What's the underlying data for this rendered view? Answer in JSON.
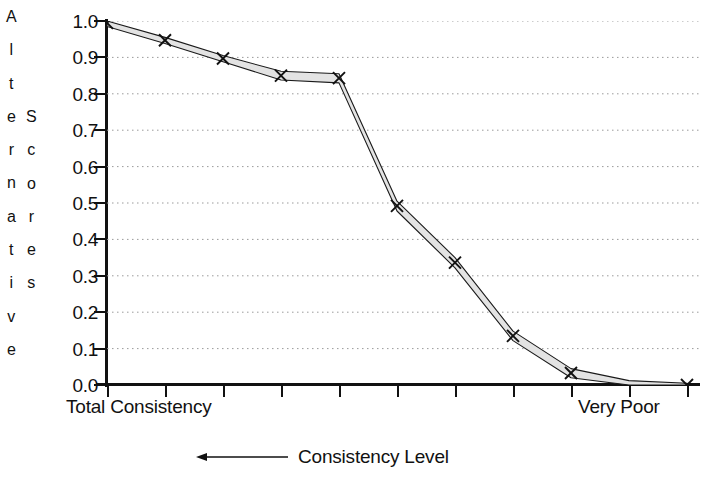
{
  "chart_data": {
    "type": "line",
    "title": "",
    "ylabel": "Alternative Scores",
    "ylabel_columns": [
      "Alternative",
      "Scores"
    ],
    "xlabel": "Consistency Level",
    "xlabel_arrow": "left-arrow-icon",
    "xtick_labels": [
      "Total Consistency",
      "Very Poor"
    ],
    "ytick_labels": [
      "1.0",
      "0.9",
      "0.8",
      "0.7",
      "0.6",
      "0.5",
      "0.4",
      "0.3",
      "0.2",
      "0.1",
      "0.0"
    ],
    "ylim": [
      0.0,
      1.0
    ],
    "ytick_values": [
      1.0,
      0.9,
      0.8,
      0.7,
      0.6,
      0.5,
      0.4,
      0.3,
      0.2,
      0.1,
      0.0
    ],
    "grid": "horizontal-dotted",
    "legend": "none",
    "marker": "x",
    "band_fill": "#e3e3e3",
    "line_color": "#1a1a1a",
    "x": [
      0,
      1,
      2,
      3,
      4,
      5,
      6,
      7,
      8,
      9,
      10
    ],
    "series": [
      {
        "name": "Alternative score (upper bound)",
        "values": [
          1.0,
          0.955,
          0.905,
          0.862,
          0.855,
          0.505,
          0.35,
          0.148,
          0.045,
          0.012,
          0.005
        ]
      },
      {
        "name": "Alternative score (lower bound)",
        "values": [
          0.985,
          0.938,
          0.888,
          0.838,
          0.83,
          0.478,
          0.322,
          0.122,
          0.02,
          0.0,
          0.0
        ]
      }
    ],
    "markers": [
      {
        "x": 0,
        "y": 0.995
      },
      {
        "x": 1,
        "y": 0.947
      },
      {
        "x": 2,
        "y": 0.897
      },
      {
        "x": 3,
        "y": 0.85
      },
      {
        "x": 4,
        "y": 0.843
      },
      {
        "x": 5,
        "y": 0.492
      },
      {
        "x": 6,
        "y": 0.336
      },
      {
        "x": 7,
        "y": 0.135
      },
      {
        "x": 8,
        "y": 0.033
      },
      {
        "x": 10,
        "y": 0.0
      }
    ]
  }
}
